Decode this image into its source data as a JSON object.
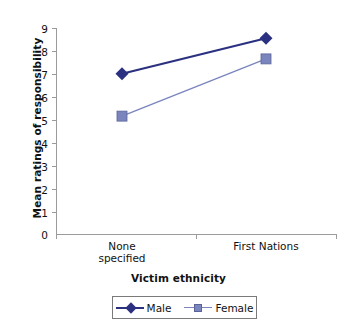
{
  "chart_data": {
    "type": "line",
    "title": "",
    "xlabel": "Victim ethnicity",
    "ylabel": "Mean ratings of responsibility",
    "categories": [
      "None\nspecified",
      "First Nations"
    ],
    "category_labels_flat": [
      "None specified",
      "First Nations"
    ],
    "ylim": [
      0,
      9
    ],
    "yticks": [
      0,
      1,
      2,
      3,
      4,
      5,
      6,
      7,
      8,
      9
    ],
    "ytick_labels": [
      "0",
      "1",
      "2",
      "3",
      "4",
      "5",
      "6",
      "7",
      "8",
      "9"
    ],
    "grid": false,
    "legend_position": "bottom",
    "series": [
      {
        "name": "Male",
        "values": [
          7.0,
          8.55
        ],
        "color": "#2b3180",
        "marker": "diamond"
      },
      {
        "name": "Female",
        "values": [
          5.15,
          7.65
        ],
        "color": "#7b85bd",
        "marker": "square"
      }
    ]
  },
  "axis": {
    "y_title": "Mean ratings of responsibility",
    "x_title": "Victim ethnicity",
    "y_ticks": [
      "9",
      "8",
      "7",
      "6",
      "5",
      "4",
      "3",
      "2",
      "1",
      "0"
    ],
    "x_ticks": [
      "None\nspecified",
      "First Nations"
    ]
  },
  "legend": {
    "items": [
      {
        "label": "Male",
        "color": "#2b3180"
      },
      {
        "label": "Female",
        "color": "#7b85bd"
      }
    ]
  },
  "colors": {
    "male": "#2b3180",
    "female": "#7b85bd",
    "axis": "#9b9b9b",
    "text": "#111111",
    "background": "#ffffff"
  }
}
